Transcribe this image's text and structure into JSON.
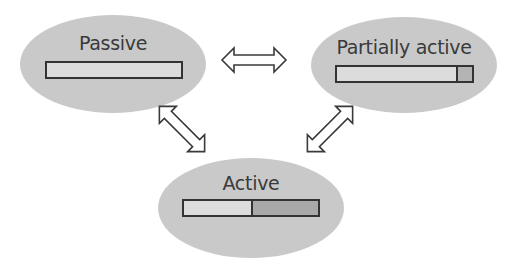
{
  "diagram": {
    "states": [
      {
        "label": "Passive",
        "bar": [
          {
            "fraction": 1.0,
            "color": "#dcdcdc"
          }
        ]
      },
      {
        "label": "Partially active",
        "bar": [
          {
            "fraction": 0.88,
            "color": "#dcdcdc"
          },
          {
            "fraction": 0.12,
            "color": "#b4b4b4"
          }
        ]
      },
      {
        "label": "Active",
        "bar": [
          {
            "fraction": 0.5,
            "color": "#dcdcdc"
          },
          {
            "fraction": 0.5,
            "color": "#a9a9a9"
          }
        ]
      }
    ],
    "arrows": [
      {
        "from": "Passive",
        "to": "Partially active",
        "type": "bidirectional"
      },
      {
        "from": "Passive",
        "to": "Active",
        "type": "bidirectional"
      },
      {
        "from": "Partially active",
        "to": "Active",
        "type": "bidirectional"
      }
    ],
    "colors": {
      "ellipse": "#c9c9c9",
      "bar_light": "#dcdcdc",
      "bar_dark": "#a9a9a9",
      "outline": "#333333"
    }
  }
}
